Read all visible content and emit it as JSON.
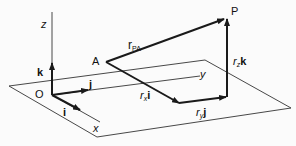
{
  "diagram": {
    "type": "vector-decomposition-3d",
    "colors": {
      "line": "#1a1a1a",
      "background": "#fbfbfb"
    },
    "axes": {
      "z_label": "z",
      "y_label": "y",
      "x_label": "x",
      "origin_label": "O"
    },
    "unit_vectors": {
      "i_label": "i",
      "j_label": "j",
      "k_label": "k"
    },
    "points": {
      "A_label": "A",
      "P_label": "P"
    },
    "vectors": {
      "r_PA": {
        "main": "r",
        "sub": "PA"
      },
      "rx_i": {
        "coef": "r",
        "sub": "x",
        "unit": "i"
      },
      "ry_j": {
        "coef": "r",
        "sub": "y",
        "unit": "j"
      },
      "rz_k": {
        "coef": "r",
        "sub": "z",
        "unit": "k"
      }
    }
  }
}
